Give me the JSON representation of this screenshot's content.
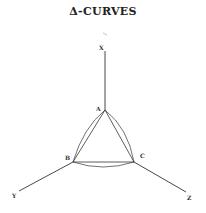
{
  "title": "Δ-CURVES",
  "diagram": {
    "labels": {
      "x_axis": "X",
      "y_axis": "Y",
      "z_axis": "Z",
      "vertex_a": "A",
      "vertex_b": "B",
      "vertex_c": "C"
    },
    "colors": {
      "line": "#333333",
      "background": "#ffffff"
    }
  }
}
